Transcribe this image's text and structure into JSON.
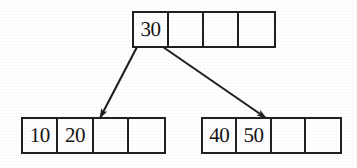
{
  "figure": {
    "background_color": "#ffffff",
    "stroke_color": "#211f1f",
    "text_color": "#141313"
  },
  "nodes": {
    "root": {
      "name": "root-node",
      "cell_count": 4,
      "cells": [
        {
          "value": "30",
          "empty": false
        },
        {
          "value": "",
          "empty": true
        },
        {
          "value": "",
          "empty": true
        },
        {
          "value": "",
          "empty": true
        }
      ]
    },
    "left_child": {
      "name": "left-child-node",
      "cell_count": 4,
      "cells": [
        {
          "value": "10",
          "empty": false
        },
        {
          "value": "20",
          "empty": false
        },
        {
          "value": "",
          "empty": true
        },
        {
          "value": "",
          "empty": true
        }
      ]
    },
    "right_child": {
      "name": "right-child-node",
      "cell_count": 4,
      "cells": [
        {
          "value": "40",
          "empty": false
        },
        {
          "value": "50",
          "empty": false
        },
        {
          "value": "",
          "empty": true
        },
        {
          "value": "",
          "empty": true
        }
      ]
    }
  },
  "edges": [
    {
      "name": "edge-root-to-left-child",
      "from": {
        "x": 137,
        "y": 47
      },
      "to": {
        "x": 100,
        "y": 118
      },
      "arrowhead": "filled-triangle",
      "color": "#211f1f"
    },
    {
      "name": "edge-root-to-right-child",
      "from": {
        "x": 163,
        "y": 47
      },
      "to": {
        "x": 266,
        "y": 118
      },
      "arrowhead": "filled-triangle",
      "color": "#211f1f"
    }
  ]
}
